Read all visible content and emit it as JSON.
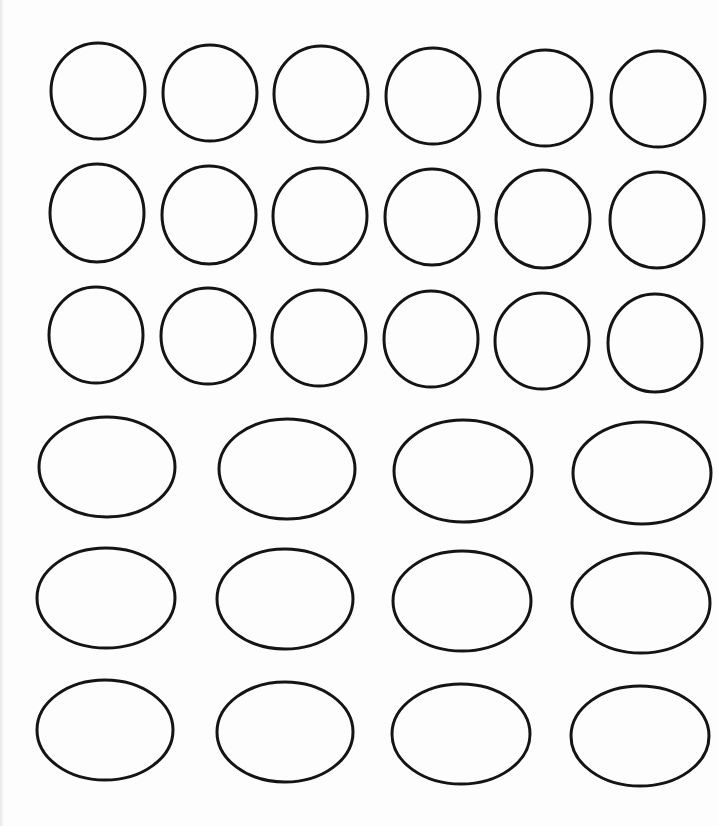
{
  "worksheet": {
    "background_color": "#fdfdfd",
    "stroke_color": "#141414",
    "stroke_width": 3,
    "circles": [
      {
        "row": 1,
        "col": 1,
        "cx": 98,
        "cy": 91,
        "rx": 47,
        "ry": 48
      },
      {
        "row": 1,
        "col": 2,
        "cx": 210,
        "cy": 93,
        "rx": 47,
        "ry": 48
      },
      {
        "row": 1,
        "col": 3,
        "cx": 321,
        "cy": 94,
        "rx": 47,
        "ry": 48
      },
      {
        "row": 1,
        "col": 4,
        "cx": 433,
        "cy": 96,
        "rx": 47,
        "ry": 48
      },
      {
        "row": 1,
        "col": 5,
        "cx": 545,
        "cy": 98,
        "rx": 47,
        "ry": 48
      },
      {
        "row": 1,
        "col": 6,
        "cx": 658,
        "cy": 99,
        "rx": 47,
        "ry": 48
      },
      {
        "row": 2,
        "col": 1,
        "cx": 97,
        "cy": 213,
        "rx": 47,
        "ry": 49
      },
      {
        "row": 2,
        "col": 2,
        "cx": 209,
        "cy": 215,
        "rx": 47,
        "ry": 49
      },
      {
        "row": 2,
        "col": 3,
        "cx": 320,
        "cy": 216,
        "rx": 47,
        "ry": 48
      },
      {
        "row": 2,
        "col": 4,
        "cx": 432,
        "cy": 217,
        "rx": 47,
        "ry": 48
      },
      {
        "row": 2,
        "col": 5,
        "cx": 543,
        "cy": 219,
        "rx": 47,
        "ry": 49
      },
      {
        "row": 2,
        "col": 6,
        "cx": 657,
        "cy": 220,
        "rx": 47,
        "ry": 48
      },
      {
        "row": 3,
        "col": 1,
        "cx": 96,
        "cy": 335,
        "rx": 47,
        "ry": 48
      },
      {
        "row": 3,
        "col": 2,
        "cx": 208,
        "cy": 336,
        "rx": 47,
        "ry": 48
      },
      {
        "row": 3,
        "col": 3,
        "cx": 319,
        "cy": 338,
        "rx": 47,
        "ry": 48
      },
      {
        "row": 3,
        "col": 4,
        "cx": 431,
        "cy": 339,
        "rx": 47,
        "ry": 48
      },
      {
        "row": 3,
        "col": 5,
        "cx": 542,
        "cy": 341,
        "rx": 47,
        "ry": 48
      },
      {
        "row": 3,
        "col": 6,
        "cx": 655,
        "cy": 343,
        "rx": 47,
        "ry": 49
      }
    ],
    "ovals": [
      {
        "row": 4,
        "col": 1,
        "cx": 107,
        "cy": 467,
        "rx": 68,
        "ry": 50
      },
      {
        "row": 4,
        "col": 2,
        "cx": 287,
        "cy": 469,
        "rx": 68,
        "ry": 50
      },
      {
        "row": 4,
        "col": 3,
        "cx": 463,
        "cy": 471,
        "rx": 69,
        "ry": 51
      },
      {
        "row": 4,
        "col": 4,
        "cx": 642,
        "cy": 473,
        "rx": 69,
        "ry": 51
      },
      {
        "row": 5,
        "col": 1,
        "cx": 106,
        "cy": 598,
        "rx": 69,
        "ry": 50
      },
      {
        "row": 5,
        "col": 2,
        "cx": 285,
        "cy": 599,
        "rx": 68,
        "ry": 50
      },
      {
        "row": 5,
        "col": 3,
        "cx": 462,
        "cy": 601,
        "rx": 69,
        "ry": 50
      },
      {
        "row": 5,
        "col": 4,
        "cx": 641,
        "cy": 603,
        "rx": 69,
        "ry": 50
      },
      {
        "row": 6,
        "col": 1,
        "cx": 105,
        "cy": 730,
        "rx": 68,
        "ry": 50
      },
      {
        "row": 6,
        "col": 2,
        "cx": 285,
        "cy": 732,
        "rx": 68,
        "ry": 50
      },
      {
        "row": 6,
        "col": 3,
        "cx": 461,
        "cy": 734,
        "rx": 69,
        "ry": 50
      },
      {
        "row": 6,
        "col": 4,
        "cx": 640,
        "cy": 736,
        "rx": 69,
        "ry": 50
      }
    ]
  }
}
